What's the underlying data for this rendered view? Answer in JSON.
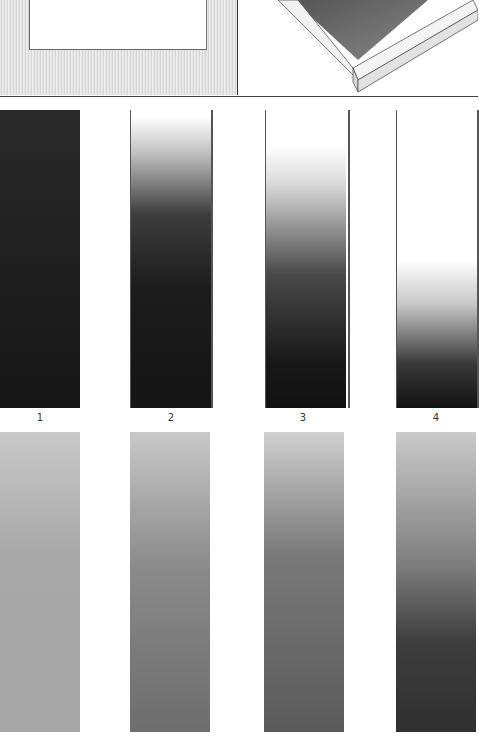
{
  "illustration": {
    "top_strip": {
      "left_panel": "frame-drawing-flat",
      "right_panel": "frame-drawing-perspective"
    },
    "row1": {
      "labels": [
        "1",
        "2",
        "3",
        "4"
      ],
      "tone": "graphite-gradient-black-to-white",
      "colors": {
        "dark": "#1a1a1a",
        "light": "#ffffff"
      }
    },
    "row2": {
      "tone": "graphite-gradient-light-to-mid-gray",
      "colors": [
        "#a9a9a9",
        "#6e6e6e",
        "#5a5a5a",
        "#343434"
      ]
    }
  }
}
